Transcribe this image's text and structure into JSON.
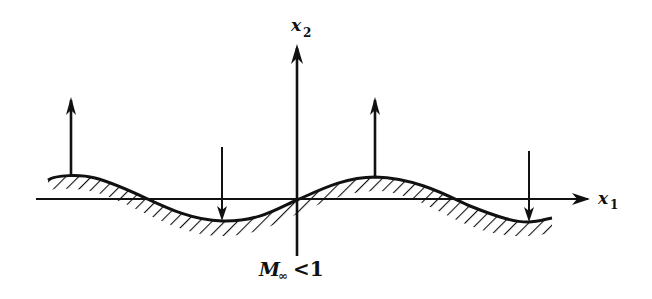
{
  "figure": {
    "x1_label": "x",
    "x1_sub": "1",
    "x2_label": "x",
    "x2_sub": "2",
    "mach_label": "M",
    "mach_sub": "∞",
    "mach_relation": "<1",
    "colors": {
      "ink": "#111111",
      "background": "#ffffff"
    },
    "wall": {
      "shape": "sinusoidal wavy wall",
      "peaks_x": [
        70,
        375
      ],
      "troughs_x": [
        222,
        528
      ],
      "hatching": "below curve"
    },
    "arrows": [
      {
        "x": 70,
        "direction": "up"
      },
      {
        "x": 222,
        "direction": "down"
      },
      {
        "x": 375,
        "direction": "up"
      },
      {
        "x": 528,
        "direction": "down"
      }
    ]
  }
}
